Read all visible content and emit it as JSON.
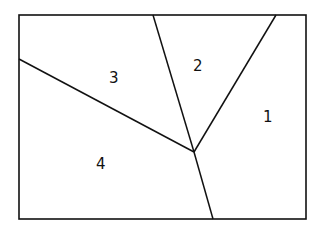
{
  "diagram": {
    "type": "partition",
    "regions": [
      {
        "id": 1,
        "label": "1"
      },
      {
        "id": 2,
        "label": "2"
      },
      {
        "id": 3,
        "label": "3"
      },
      {
        "id": 4,
        "label": "4"
      }
    ],
    "stroke_color": "#111111",
    "background": "#ffffff"
  }
}
